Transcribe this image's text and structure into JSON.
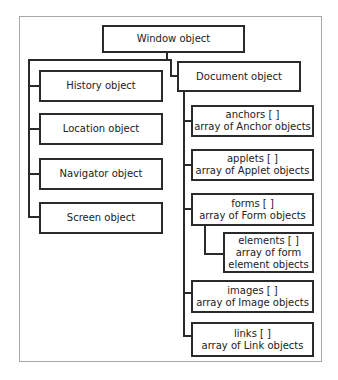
{
  "diagram": {
    "root": {
      "label": "Window object"
    },
    "window_children": [
      {
        "label": "History object"
      },
      {
        "label": "Location object"
      },
      {
        "label": "Navigator object"
      },
      {
        "label": "Screen object"
      }
    ],
    "document": {
      "label": "Document object",
      "children": [
        {
          "title": "anchors [ ]",
          "desc": "array of Anchor objects"
        },
        {
          "title": "applets [ ]",
          "desc": "array of Applet objects"
        },
        {
          "title": "forms [ ]",
          "desc": "array of Form objects"
        },
        {
          "title": "images [ ]",
          "desc": "array of Image objects"
        },
        {
          "title": "links [ ]",
          "desc": "array of Link objects"
        }
      ],
      "forms_child": {
        "title": "elements [ ]",
        "line2": "array of form",
        "line3": "element objects"
      }
    }
  }
}
